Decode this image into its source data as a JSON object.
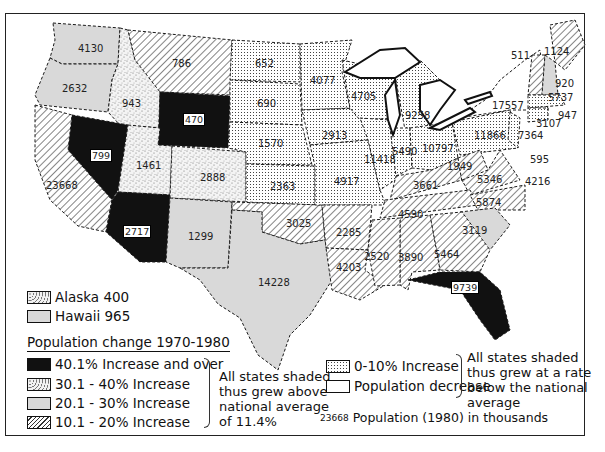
{
  "map": {
    "title": "Population change 1970-1980",
    "states": [
      {
        "abbr": "WA",
        "pop": "4130",
        "category": "20-30"
      },
      {
        "abbr": "OR",
        "pop": "2632",
        "category": "20-30"
      },
      {
        "abbr": "CA",
        "pop": "23668",
        "category": "10-20"
      },
      {
        "abbr": "ID",
        "pop": "943",
        "category": "30-40"
      },
      {
        "abbr": "NV",
        "pop": "799",
        "category": "40+"
      },
      {
        "abbr": "MT",
        "pop": "786",
        "category": "10-20"
      },
      {
        "abbr": "WY",
        "pop": "470",
        "category": "40+"
      },
      {
        "abbr": "UT",
        "pop": "1461",
        "category": "30-40"
      },
      {
        "abbr": "AZ",
        "pop": "2717",
        "category": "40+"
      },
      {
        "abbr": "CO",
        "pop": "2888",
        "category": "30-40"
      },
      {
        "abbr": "NM",
        "pop": "1299",
        "category": "20-30"
      },
      {
        "abbr": "ND",
        "pop": "652",
        "category": "0-10"
      },
      {
        "abbr": "SD",
        "pop": "690",
        "category": "0-10"
      },
      {
        "abbr": "NE",
        "pop": "1570",
        "category": "0-10"
      },
      {
        "abbr": "KS",
        "pop": "2363",
        "category": "0-10"
      },
      {
        "abbr": "OK",
        "pop": "3025",
        "category": "10-20"
      },
      {
        "abbr": "TX",
        "pop": "14228",
        "category": "20-30"
      },
      {
        "abbr": "MN",
        "pop": "4077",
        "category": "0-10"
      },
      {
        "abbr": "IA",
        "pop": "2913",
        "category": "0-10"
      },
      {
        "abbr": "MO",
        "pop": "4917",
        "category": "0-10"
      },
      {
        "abbr": "AR",
        "pop": "2285",
        "category": "10-20"
      },
      {
        "abbr": "LA",
        "pop": "4203",
        "category": "10-20"
      },
      {
        "abbr": "WI",
        "pop": "4705",
        "category": "0-10"
      },
      {
        "abbr": "IL",
        "pop": "11418",
        "category": "0-10"
      },
      {
        "abbr": "MI",
        "pop": "9258",
        "category": "0-10"
      },
      {
        "abbr": "IN",
        "pop": "5490",
        "category": "0-10"
      },
      {
        "abbr": "OH",
        "pop": "10797",
        "category": "0-10"
      },
      {
        "abbr": "KY",
        "pop": "3661",
        "category": "10-20"
      },
      {
        "abbr": "TN",
        "pop": "4590",
        "category": "10-20"
      },
      {
        "abbr": "MS",
        "pop": "2520",
        "category": "10-20"
      },
      {
        "abbr": "AL",
        "pop": "3890",
        "category": "10-20"
      },
      {
        "abbr": "GA",
        "pop": "5464",
        "category": "10-20"
      },
      {
        "abbr": "FL",
        "pop": "9739",
        "category": "40+"
      },
      {
        "abbr": "SC",
        "pop": "3119",
        "category": "20-30"
      },
      {
        "abbr": "NC",
        "pop": "5874",
        "category": "10-20"
      },
      {
        "abbr": "VA",
        "pop": "5346",
        "category": "10-20"
      },
      {
        "abbr": "WV",
        "pop": "1949",
        "category": "10-20"
      },
      {
        "abbr": "MD",
        "pop": "4216",
        "category": "0-10"
      },
      {
        "abbr": "DE",
        "pop": "595",
        "category": "0-10"
      },
      {
        "abbr": "PA",
        "pop": "11866",
        "category": "0-10"
      },
      {
        "abbr": "NJ",
        "pop": "7364",
        "category": "0-10"
      },
      {
        "abbr": "NY",
        "pop": "17557",
        "category": "decrease"
      },
      {
        "abbr": "VT",
        "pop": "511",
        "category": "10-20"
      },
      {
        "abbr": "NH",
        "pop": "920",
        "category": "20-30"
      },
      {
        "abbr": "ME",
        "pop": "1124",
        "category": "10-20"
      },
      {
        "abbr": "MA",
        "pop": "5737",
        "category": "0-10"
      },
      {
        "abbr": "RI",
        "pop": "947",
        "category": "0-10"
      },
      {
        "abbr": "CT",
        "pop": "3107",
        "category": "0-10"
      }
    ]
  },
  "insets": {
    "alaska": "Alaska 400",
    "hawaii": "Hawaii 965"
  },
  "legend": {
    "title": "Population change 1970-1980",
    "above": [
      {
        "label": "40.1% Increase and over",
        "pattern": "solid-black"
      },
      {
        "label": "30.1 - 40% Increase",
        "pattern": "stipple"
      },
      {
        "label": "20.1 - 30% Increase",
        "pattern": "light-gray"
      },
      {
        "label": "10.1 - 20% Increase",
        "pattern": "diagonal-hatch"
      }
    ],
    "above_note": [
      "All states shaded",
      "thus grew above",
      "national average",
      "of 11.4%"
    ],
    "below": [
      {
        "label": "0-10% Increase",
        "pattern": "dot-grid"
      },
      {
        "label": "Population decrease",
        "pattern": "white"
      }
    ],
    "below_note": [
      "All states shaded",
      "thus grew at a rate",
      "below the national",
      "average"
    ],
    "units_sample": "23668",
    "units_text": "Population (1980) in thousands"
  },
  "colors": {
    "black": "#111111",
    "gray": "#d9d9d9",
    "line": "#1a1a1a"
  }
}
